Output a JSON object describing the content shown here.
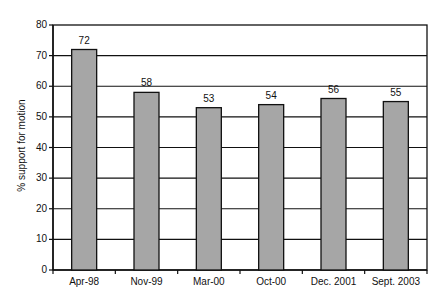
{
  "chart_data": {
    "type": "bar",
    "title": "",
    "xlabel": "",
    "ylabel": "% support for motion",
    "categories": [
      "Apr-98",
      "Nov-99",
      "Mar-00",
      "Oct-00",
      "Dec. 2001",
      "Sept. 2003"
    ],
    "values": [
      72,
      58,
      53,
      54,
      56,
      55
    ],
    "data_labels": [
      "72",
      "58",
      "53",
      "54",
      "56",
      "55"
    ],
    "ylim": [
      0,
      80
    ],
    "yticks": [
      0,
      10,
      20,
      30,
      40,
      50,
      60,
      70,
      80
    ],
    "grid": true,
    "legend": null,
    "colors": {
      "bar": "#a6a6a6",
      "bar_edge": "#111111",
      "grid": "#111111"
    }
  }
}
